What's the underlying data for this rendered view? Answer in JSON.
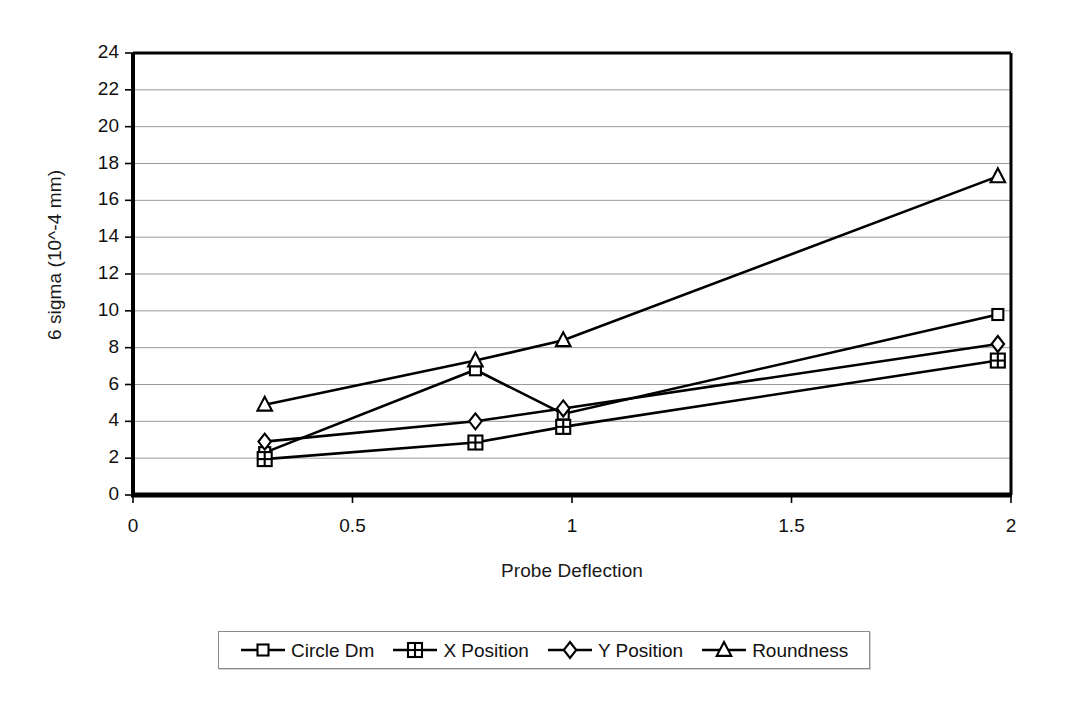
{
  "chart_data": {
    "type": "line",
    "title": "",
    "xlabel": "Probe Deflection",
    "ylabel": "6 sigma (10^-4 mm)",
    "xlim": [
      0,
      2
    ],
    "ylim": [
      0,
      24
    ],
    "xticks": [
      "0",
      "0.5",
      "1",
      "1.5",
      "2"
    ],
    "xtick_values": [
      0,
      0.5,
      1,
      1.5,
      2
    ],
    "yticks": [
      "0",
      "2",
      "4",
      "6",
      "8",
      "10",
      "12",
      "14",
      "16",
      "18",
      "20",
      "22",
      "24"
    ],
    "ytick_values": [
      0,
      2,
      4,
      6,
      8,
      10,
      12,
      14,
      16,
      18,
      20,
      22,
      24
    ],
    "grid": "horizontal",
    "legend_position": "bottom",
    "x": [
      0.3,
      0.78,
      0.98,
      1.97
    ],
    "series": [
      {
        "name": "Circle Dm",
        "marker": "square",
        "values": [
          2.3,
          6.8,
          4.4,
          9.8
        ]
      },
      {
        "name": "X Position",
        "marker": "crossed-square",
        "values": [
          1.95,
          2.85,
          3.7,
          7.3
        ]
      },
      {
        "name": "Y Position",
        "marker": "diamond",
        "values": [
          2.9,
          4.0,
          4.7,
          8.2
        ]
      },
      {
        "name": "Roundness",
        "marker": "triangle",
        "values": [
          4.9,
          7.3,
          8.4,
          17.3
        ]
      }
    ],
    "line_color": "#000000",
    "grid_color": "#9a9a9a",
    "axis_color": "#000000",
    "background_color": "#ffffff"
  }
}
